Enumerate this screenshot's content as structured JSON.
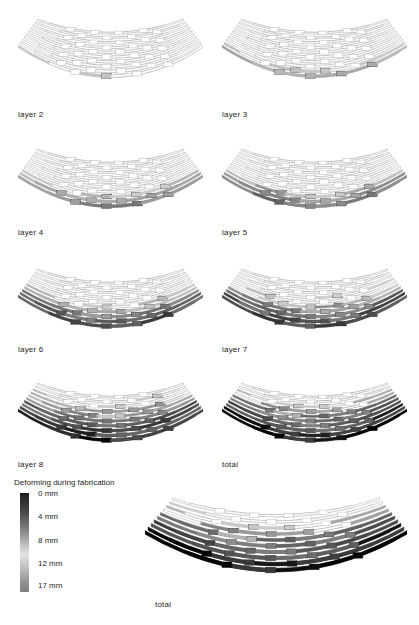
{
  "figure": {
    "kind": "deformation-diagram-grid",
    "background": "#ffffff"
  },
  "panels": [
    {
      "id": "layer-2",
      "label": "layer 2",
      "x": 18,
      "y": 8,
      "w": 185,
      "h": 100,
      "label_x": 18,
      "label_y": 110,
      "dark_rows": 2,
      "darkness": 0.18
    },
    {
      "id": "layer-3",
      "label": "layer 3",
      "x": 222,
      "y": 8,
      "w": 185,
      "h": 100,
      "label_x": 222,
      "label_y": 110,
      "dark_rows": 3,
      "darkness": 0.3
    },
    {
      "id": "layer-4",
      "label": "layer 4",
      "x": 18,
      "y": 138,
      "w": 185,
      "h": 100,
      "label_x": 18,
      "label_y": 228,
      "dark_rows": 4,
      "darkness": 0.45
    },
    {
      "id": "layer-5",
      "label": "layer 5",
      "x": 222,
      "y": 138,
      "w": 185,
      "h": 100,
      "label_x": 222,
      "label_y": 228,
      "dark_rows": 5,
      "darkness": 0.52
    },
    {
      "id": "layer-6",
      "label": "layer 6",
      "x": 18,
      "y": 258,
      "w": 185,
      "h": 100,
      "label_x": 18,
      "label_y": 345,
      "dark_rows": 6,
      "darkness": 0.66
    },
    {
      "id": "layer-7",
      "label": "layer 7",
      "x": 222,
      "y": 258,
      "w": 185,
      "h": 100,
      "label_x": 222,
      "label_y": 345,
      "dark_rows": 7,
      "darkness": 0.75
    },
    {
      "id": "layer-8",
      "label": "layer 8",
      "x": 18,
      "y": 372,
      "w": 185,
      "h": 100,
      "label_x": 18,
      "label_y": 460,
      "dark_rows": 9,
      "darkness": 0.86
    },
    {
      "id": "total-small",
      "label": "total",
      "x": 222,
      "y": 372,
      "w": 185,
      "h": 100,
      "label_x": 222,
      "label_y": 460,
      "dark_rows": 10,
      "darkness": 0.92
    }
  ],
  "total_panel": {
    "id": "total-large",
    "label": "total",
    "x": 145,
    "y": 484,
    "w": 262,
    "h": 126,
    "label_x": 155,
    "label_y": 600,
    "dark_rows": 10,
    "darkness": 0.95
  },
  "legend": {
    "title": "Deforming during fabrication",
    "unit": "mm",
    "ticks": [
      {
        "value": "0 mm",
        "pos": 0
      },
      {
        "value": "4 mm",
        "pos": 23
      },
      {
        "value": "8 mm",
        "pos": 47
      },
      {
        "value": "12 mm",
        "pos": 70
      },
      {
        "value": "17 mm",
        "pos": 92
      }
    ],
    "gradient_from": "#1c1c1c",
    "gradient_mid": "#e2e2e2",
    "gradient_to": "#7c7c7c",
    "min": 0,
    "max": 17
  },
  "chart_data": {
    "type": "heatmap",
    "title": "Deforming during fabrication",
    "xlabel": "",
    "ylabel": "",
    "colorbar_label": "Deforming during fabrication",
    "colorbar_ticks": [
      "0 mm",
      "4 mm",
      "8 mm",
      "12 mm",
      "17 mm"
    ],
    "value_range": [
      0,
      17
    ],
    "unit": "mm",
    "categories": [
      "layer 2",
      "layer 3",
      "layer 4",
      "layer 5",
      "layer 6",
      "layer 7",
      "layer 8",
      "total"
    ],
    "series": [
      {
        "name": "mean deformation per layer (mm)",
        "values": [
          3.1,
          5.1,
          7.6,
          8.8,
          11.2,
          12.8,
          14.6,
          15.6
        ]
      }
    ],
    "legend_position": "bottom-left",
    "grid": false
  }
}
